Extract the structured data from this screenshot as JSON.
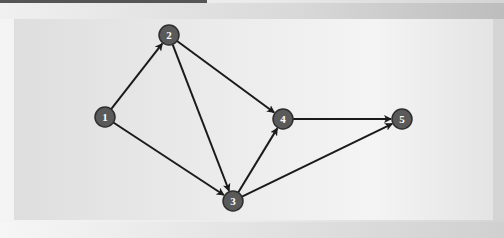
{
  "diagram": {
    "type": "directed-graph",
    "colors": {
      "node_fill": "#5a5a5a",
      "node_stroke": "#2e2e2e",
      "edge": "#1a1a1a",
      "label": "#ffffff"
    },
    "nodes": [
      {
        "id": "1",
        "label": "1",
        "x": 105,
        "y": 117
      },
      {
        "id": "2",
        "label": "2",
        "x": 169,
        "y": 35
      },
      {
        "id": "3",
        "label": "3",
        "x": 233,
        "y": 201
      },
      {
        "id": "4",
        "label": "4",
        "x": 283,
        "y": 119
      },
      {
        "id": "5",
        "label": "5",
        "x": 402,
        "y": 119
      }
    ],
    "edges": [
      {
        "from": "1",
        "to": "2"
      },
      {
        "from": "1",
        "to": "3"
      },
      {
        "from": "2",
        "to": "3"
      },
      {
        "from": "2",
        "to": "4"
      },
      {
        "from": "3",
        "to": "4"
      },
      {
        "from": "3",
        "to": "5"
      },
      {
        "from": "4",
        "to": "5"
      }
    ]
  }
}
